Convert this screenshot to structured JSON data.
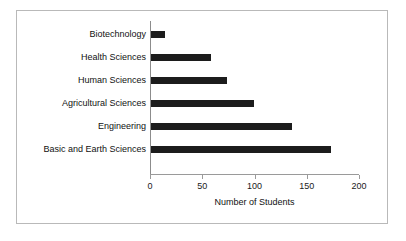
{
  "chart_data": {
    "type": "bar",
    "orientation": "horizontal",
    "title": "",
    "xlabel": "Number of Students",
    "ylabel": "",
    "xlim": [
      0,
      200
    ],
    "xticks": [
      0,
      50,
      100,
      150,
      200
    ],
    "xtick_labels": [
      "0",
      "50",
      "100",
      "150",
      "200"
    ],
    "grid": false,
    "legend": false,
    "bar_color": "#1c1c1c",
    "categories": [
      "Biotechnology",
      "Health Sciences",
      "Human Sciences",
      "Agricultural Sciences",
      "Engineering",
      "Basic and Earth Sciences"
    ],
    "values": [
      13,
      57,
      73,
      99,
      135,
      172
    ],
    "series": [
      {
        "name": "Number of Students",
        "values": [
          13,
          57,
          73,
          99,
          135,
          172
        ]
      }
    ]
  },
  "axis": {
    "x_title": "Number of Students"
  }
}
